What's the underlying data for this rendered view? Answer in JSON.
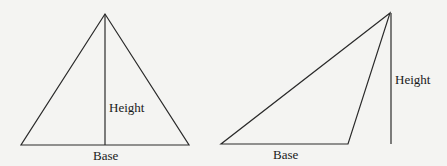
{
  "figure": {
    "left_triangle": {
      "type": "acute",
      "height_label": "Height",
      "base_label": "Base",
      "vertices": {
        "apex": [
          105,
          14
        ],
        "base_left": [
          21,
          145
        ],
        "base_right": [
          189,
          145
        ]
      },
      "height_line": {
        "x": 105,
        "y1": 14,
        "y2": 145
      }
    },
    "right_triangle": {
      "type": "obtuse",
      "height_label": "Height",
      "base_label": "Base",
      "vertices": {
        "apex": [
          390,
          13
        ],
        "base_left": [
          221,
          144
        ],
        "base_right": [
          348,
          144
        ]
      },
      "height_line": {
        "x": 391,
        "y1": 13,
        "y2": 144
      }
    },
    "colors": {
      "stroke": "#2a2a2a",
      "background": "#f4f4f2",
      "text": "#1a1a1a"
    }
  }
}
